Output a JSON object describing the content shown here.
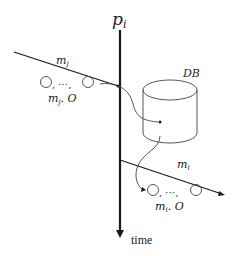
{
  "diagram": {
    "process_label": "p",
    "process_subscript": "i",
    "time_label": "time",
    "database_label": "DB",
    "incoming_message": {
      "label": "m",
      "subscript": "j",
      "objects_text": ", ⋯, ",
      "objects_label": "m",
      "objects_label_sub": "j",
      "objects_label_suffix": ". O"
    },
    "outgoing_message": {
      "label": "m",
      "subscript": "i",
      "objects_text": ", ⋯, ",
      "objects_label": "m",
      "objects_label_sub": "i",
      "objects_label_suffix": ". O"
    },
    "colors": {
      "line": "#1a1a1a",
      "thin_line": "#444444",
      "background": "#ffffff"
    }
  }
}
